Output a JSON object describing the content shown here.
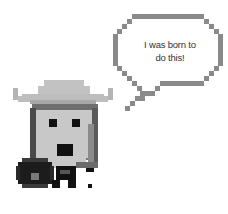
{
  "speech_bubble": {
    "line1": "I was born to",
    "line2": "do this!"
  },
  "character": {
    "description": "pixel-art knight with wide-brim hat, round shield and sword"
  },
  "colors": {
    "outline": "#888888",
    "hat_light": "#bdbdbd",
    "hat_band": "#6e6e6e",
    "face": "#c8c8c8",
    "hair_dark": "#4a4a4a",
    "black": "#111111",
    "shield_dark": "#1c1c1c",
    "shield_boss": "#7a7a7a",
    "sword": "#8a8a8a"
  }
}
